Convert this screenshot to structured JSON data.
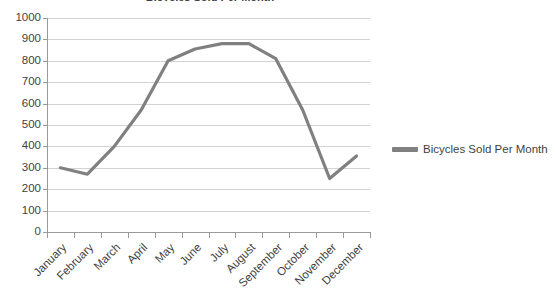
{
  "chart_data": {
    "type": "line",
    "title": "Bicycles Sold Per Month",
    "xlabel": "",
    "ylabel": "",
    "categories": [
      "January",
      "February",
      "March",
      "April",
      "May",
      "June",
      "July",
      "August",
      "September",
      "October",
      "November",
      "December"
    ],
    "series": [
      {
        "name": "Bicycles Sold Per Month",
        "color": "#808080",
        "values": [
          300,
          270,
          400,
          570,
          800,
          855,
          880,
          880,
          810,
          570,
          250,
          355
        ]
      }
    ],
    "ylim": [
      0,
      1000
    ],
    "y_ticks": [
      0,
      100,
      200,
      300,
      400,
      500,
      600,
      700,
      800,
      900,
      1000
    ],
    "y_tick_labels": [
      "0",
      "100",
      "200",
      "300",
      "400",
      "500",
      "600",
      "700",
      "800",
      "900",
      "1000"
    ],
    "grid": true,
    "grid_axis": "y",
    "legend": true,
    "legend_position": "right",
    "markers": false
  },
  "legend": {
    "entries": [
      {
        "label": "Bicycles Sold Per Month",
        "color": "#808080"
      }
    ]
  },
  "colors": {
    "series": "#808080",
    "gridline": "#d2d2d2",
    "axis": "#9a9a9a",
    "text": "#3f3f3f",
    "background": "#ffffff"
  }
}
